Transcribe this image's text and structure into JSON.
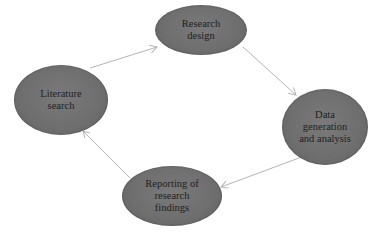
{
  "diagram": {
    "type": "cycle",
    "colors": {
      "node_fill": "#6e6e6e",
      "node_text": "#1f1f1f",
      "arrow": "#b5b5b5",
      "background": "#ffffff"
    },
    "nodes": [
      {
        "id": "research-design",
        "label": "Research\ndesign",
        "cx": 201,
        "cy": 30,
        "rx": 46,
        "ry": 25
      },
      {
        "id": "data-generation",
        "label": "Data\ngeneration\nand analysis",
        "cx": 325,
        "cy": 127,
        "rx": 43,
        "ry": 38
      },
      {
        "id": "reporting",
        "label": "Reporting of\nresearch\nfindings",
        "cx": 172,
        "cy": 196,
        "rx": 50,
        "ry": 30
      },
      {
        "id": "literature-search",
        "label": "Literature\nsearch",
        "cx": 61,
        "cy": 100,
        "rx": 47,
        "ry": 35
      }
    ],
    "edges": [
      {
        "from": "literature-search",
        "to": "research-design",
        "x1": 90,
        "y1": 68,
        "x2": 157,
        "y2": 47
      },
      {
        "from": "research-design",
        "to": "data-generation",
        "x1": 243,
        "y1": 47,
        "x2": 296,
        "y2": 95
      },
      {
        "from": "data-generation",
        "to": "reporting",
        "x1": 307,
        "y1": 155,
        "x2": 221,
        "y2": 187
      },
      {
        "from": "reporting",
        "to": "literature-search",
        "x1": 130,
        "y1": 178,
        "x2": 83,
        "y2": 131
      }
    ]
  }
}
